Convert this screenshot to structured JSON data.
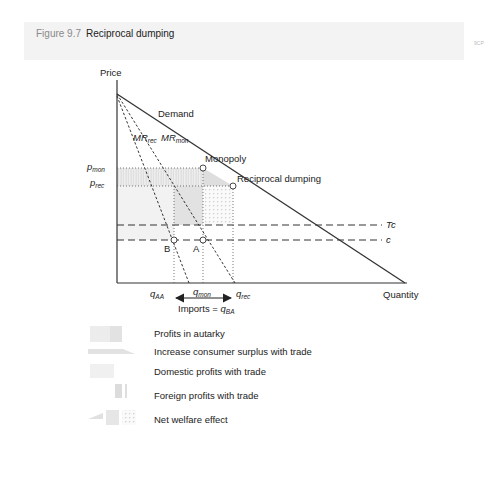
{
  "figure": {
    "number": "Figure 9.7",
    "title": "Reciprocal dumping",
    "corner_mark": "9CP"
  },
  "diagram": {
    "axes": {
      "y_label": "Price",
      "x_label": "Quantity"
    },
    "curves": {
      "demand": "Demand",
      "mr_rec": {
        "base": "MR",
        "sub": "rec"
      },
      "mr_mon": {
        "base": "MR",
        "sub": "mon"
      },
      "tc": "Tc",
      "c": "c"
    },
    "points": {
      "monopoly": "Monopoly",
      "reciprocal": "Reciprocal dumping",
      "a": "A",
      "b": "B"
    },
    "price_labels": {
      "p_mon": {
        "base": "p",
        "sub": "mon"
      },
      "p_rec": {
        "base": "p",
        "sub": "rec"
      }
    },
    "quantity_labels": {
      "q_aa": {
        "base": "q",
        "sub": "AA"
      },
      "q_mon": {
        "base": "q",
        "sub": "mon"
      },
      "q_rec": {
        "base": "q",
        "sub": "rec"
      }
    },
    "imports": {
      "text": "Imports = ",
      "base": "q",
      "sub": "BA"
    }
  },
  "legend": {
    "items": [
      {
        "label": "Profits in autarky"
      },
      {
        "label": "Increase consumer surplus with trade"
      },
      {
        "label": "Domestic profits with trade"
      },
      {
        "label": "Foreign profits with trade"
      },
      {
        "label": "Net welfare effect"
      }
    ]
  },
  "colors": {
    "header_bg": "#f3f3f3",
    "line": "#333333",
    "shade_light": "#ececec",
    "shade_mid": "#dcdcdc"
  }
}
